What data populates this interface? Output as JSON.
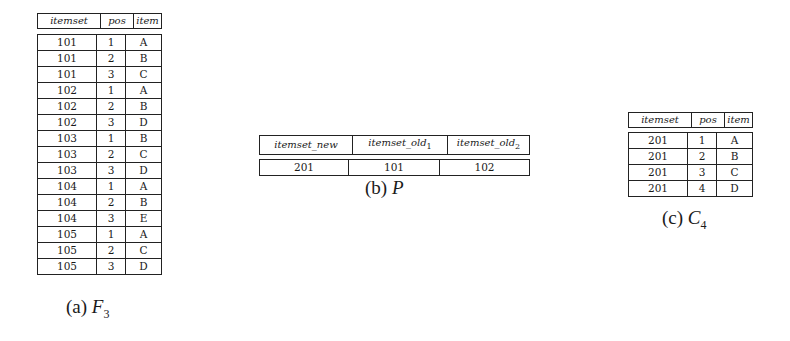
{
  "figures": {
    "f3": {
      "caption_label": "(a)",
      "caption_symbol": "F",
      "caption_subscript": "3",
      "headers": [
        "itemset",
        "pos",
        "item"
      ],
      "rows": [
        [
          "101",
          "1",
          "A"
        ],
        [
          "101",
          "2",
          "B"
        ],
        [
          "101",
          "3",
          "C"
        ],
        [
          "102",
          "1",
          "A"
        ],
        [
          "102",
          "2",
          "B"
        ],
        [
          "102",
          "3",
          "D"
        ],
        [
          "103",
          "1",
          "B"
        ],
        [
          "103",
          "2",
          "C"
        ],
        [
          "103",
          "3",
          "D"
        ],
        [
          "104",
          "1",
          "A"
        ],
        [
          "104",
          "2",
          "B"
        ],
        [
          "104",
          "3",
          "E"
        ],
        [
          "105",
          "1",
          "A"
        ],
        [
          "105",
          "2",
          "C"
        ],
        [
          "105",
          "3",
          "D"
        ]
      ]
    },
    "p": {
      "caption_label": "(b)",
      "caption_symbol": "P",
      "headers": [
        "itemset_new",
        "itemset_old",
        "itemset_old"
      ],
      "header_subscripts": [
        "",
        "1",
        "2"
      ],
      "rows": [
        [
          "201",
          "101",
          "102"
        ]
      ]
    },
    "c4": {
      "caption_label": "(c)",
      "caption_symbol": "C",
      "caption_subscript": "4",
      "headers": [
        "itemset",
        "pos",
        "item"
      ],
      "rows": [
        [
          "201",
          "1",
          "A"
        ],
        [
          "201",
          "2",
          "B"
        ],
        [
          "201",
          "3",
          "C"
        ],
        [
          "201",
          "4",
          "D"
        ]
      ]
    }
  }
}
